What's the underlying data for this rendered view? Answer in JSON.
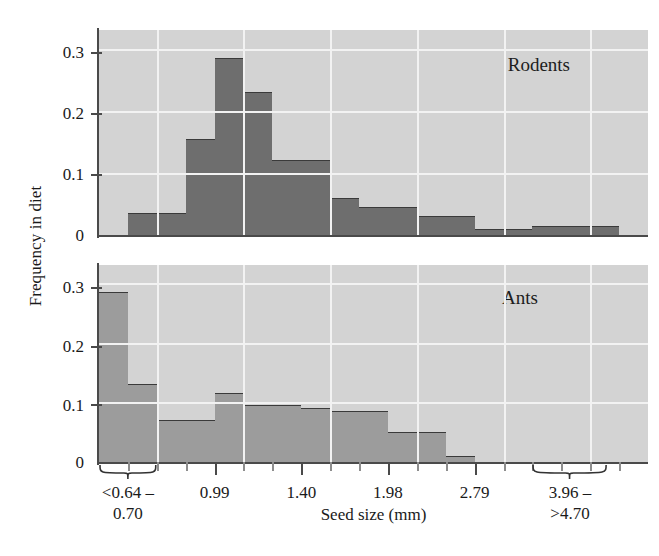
{
  "axes": {
    "ylabel": "Frequency in diet",
    "xlabel": "Seed size (mm)",
    "yticks": [
      "0.3",
      "0.2",
      "0.1",
      "0"
    ],
    "yticks_ants": [
      "0.3",
      "0.2",
      "0.1",
      "0"
    ],
    "xticklabels": [
      "<0.64 –\n0.70",
      "0.99",
      "1.40",
      "1.98",
      "2.79",
      "3.96 –\n>4.70"
    ]
  },
  "panels": {
    "rodents": {
      "name": "Rodents"
    },
    "ants": {
      "name": "Ants"
    }
  },
  "colors": {
    "panel_background": "#d3d3d3",
    "gridline": "#f2f2f2",
    "rodents_bar": "#6e6e6e",
    "ants_bar": "#9c9c9c",
    "axis": "#4a4a4a",
    "text": "#1a1a1a"
  },
  "chart_data": {
    "type": "bar",
    "title": "",
    "xlabel": "Seed size (mm)",
    "ylabel": "Frequency in diet",
    "ylim": [
      0,
      0.33
    ],
    "yticks": [
      0,
      0.1,
      0.2,
      0.3
    ],
    "grid": true,
    "legend": "none",
    "note": "Two stacked histogram panels sharing one x axis of seed-size bins. Labelled x ticks occur at bins 0.99, 1.40, 1.98, 2.79; the leftmost group is bracketed '<0.64 - 0.70' and the rightmost group is bracketed '3.96 - >4.70'.",
    "categories": [
      "<0.64",
      "0.70",
      "0.78",
      "0.88",
      "0.99",
      "1.11",
      "1.25",
      "1.40",
      "1.57",
      "1.76",
      "1.98",
      "2.22",
      "2.49",
      "2.79",
      "3.13",
      "3.52",
      "3.96",
      "4.44",
      ">4.70"
    ],
    "xtick_positions": [
      4,
      7,
      10,
      13
    ],
    "series": [
      {
        "name": "Rodents",
        "panel": "rodents",
        "values": [
          0.0,
          0.035,
          0.035,
          0.155,
          0.285,
          0.23,
          0.12,
          0.12,
          0.06,
          0.045,
          0.045,
          0.03,
          0.03,
          0.01,
          0.01,
          0.015,
          0.015,
          0.015,
          0.0
        ]
      },
      {
        "name": "Ants",
        "panel": "ants",
        "values": [
          0.285,
          0.13,
          0.07,
          0.07,
          0.115,
          0.095,
          0.095,
          0.09,
          0.085,
          0.085,
          0.05,
          0.05,
          0.01,
          0.0,
          0.0,
          0.0,
          0.0,
          0.0,
          0.0
        ]
      }
    ]
  }
}
